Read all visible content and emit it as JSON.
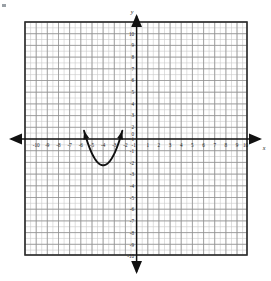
{
  "figure": {
    "type": "coordinate-plane-graph",
    "axis_labels": {
      "x": "x",
      "y": "y"
    },
    "x_ticks": [
      "-10",
      "-9",
      "-8",
      "-7",
      "-6",
      "-5",
      "-4",
      "-3",
      "-2",
      "-1",
      "1",
      "2",
      "3",
      "4",
      "5",
      "6",
      "7",
      "8",
      "9",
      "10"
    ],
    "y_ticks": [
      "10",
      "9",
      "8",
      "7",
      "6",
      "5",
      "4",
      "3",
      "2",
      "1",
      "-1",
      "-2",
      "-3",
      "-4",
      "-5",
      "-6",
      "-7",
      "-8",
      "-9",
      "-10"
    ],
    "origin_label": "0",
    "colors": {
      "grid_minor": "#c9c9c9",
      "grid_major": "#8d8d8d",
      "frame": "#2b2b2b",
      "axis": "#111111",
      "curve": "#111111",
      "label": "#1a1a1a",
      "background": "#ffffff"
    }
  },
  "chart_data": {
    "type": "line",
    "title": "",
    "xlabel": "x",
    "ylabel": "y",
    "xlim": [
      -10.5,
      10.5
    ],
    "ylim": [
      -10.5,
      10.5
    ],
    "grid": true,
    "legend": "none",
    "xticks": [
      -10,
      -9,
      -8,
      -7,
      -6,
      -5,
      -4,
      -3,
      -2,
      -1,
      1,
      2,
      3,
      4,
      5,
      6,
      7,
      8,
      9,
      10
    ],
    "yticks": [
      10,
      9,
      8,
      7,
      6,
      5,
      4,
      3,
      2,
      1,
      -1,
      -2,
      -3,
      -4,
      -5,
      -6,
      -7,
      -8,
      -9,
      -10
    ],
    "series": [
      {
        "name": "parabola",
        "equation": "y = 4(x + 3)^2 - 2.25",
        "vertex": [
          -3,
          -2.25
        ],
        "x_intercepts": [
          -4.5,
          -1.5
        ],
        "opens": "up",
        "x": [
          -4.72,
          -4.5,
          -4.25,
          -4.0,
          -3.75,
          -3.5,
          -3.25,
          -3.0,
          -2.75,
          -2.5,
          -2.25,
          -2.0,
          -1.75,
          -1.5,
          -1.25,
          -1.0,
          -0.78
        ],
        "y": [
          9.3,
          0,
          1.75,
          1.75,
          0.0,
          -1.25,
          -2.0,
          -2.25,
          -2.0,
          -1.25,
          0.0,
          1.75,
          4.0,
          0,
          9.0,
          9.0,
          9.3
        ],
        "y_values": [
          9.3,
          0.0,
          -1.25,
          -2.0,
          -2.25,
          -2.0,
          -1.25,
          0.0,
          1.75,
          4.0,
          6.75,
          9.3
        ],
        "arrow_ends": [
          [
            -4.72,
            9.5
          ],
          [
            -1.28,
            9.5
          ]
        ]
      }
    ]
  }
}
